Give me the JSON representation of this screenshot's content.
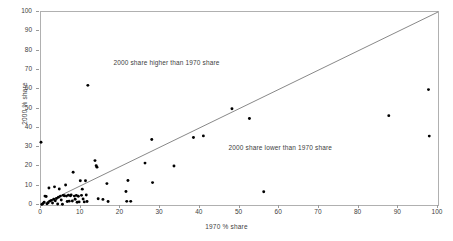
{
  "chart_data": {
    "type": "scatter",
    "title": "",
    "xlabel": "1970 % share",
    "ylabel": "2000 % share",
    "xlim": [
      0,
      100
    ],
    "ylim": [
      0,
      100
    ],
    "xticks": [
      0,
      10,
      20,
      30,
      40,
      50,
      60,
      70,
      80,
      90,
      100
    ],
    "yticks": [
      0,
      10,
      20,
      30,
      40,
      50,
      60,
      70,
      80,
      90,
      100
    ],
    "grid": false,
    "legend": null,
    "marker_color": "#000000",
    "reference_line": {
      "name": "equality-line",
      "from": [
        0,
        0
      ],
      "to": [
        100,
        100
      ],
      "color": "#555555"
    },
    "annotations": [
      {
        "text": "2000 share higher than 1970 share",
        "x": 18.5,
        "y": 73
      },
      {
        "text": "2000 share lower than 1970 share",
        "x": 47.5,
        "y": 29
      }
    ],
    "points": [
      [
        0.0,
        32.5
      ],
      [
        0.2,
        0.3
      ],
      [
        0.5,
        0.8
      ],
      [
        0.8,
        1.5
      ],
      [
        1.0,
        4.6
      ],
      [
        1.3,
        4.4
      ],
      [
        1.5,
        0.6
      ],
      [
        1.8,
        1.2
      ],
      [
        2.0,
        8.8
      ],
      [
        2.2,
        2.0
      ],
      [
        2.6,
        2.4
      ],
      [
        2.9,
        1.0
      ],
      [
        3.2,
        3.0
      ],
      [
        3.4,
        9.4
      ],
      [
        3.6,
        2.2
      ],
      [
        3.9,
        3.4
      ],
      [
        4.2,
        0.5
      ],
      [
        4.4,
        4.0
      ],
      [
        4.6,
        8.3
      ],
      [
        4.9,
        4.6
      ],
      [
        5.1,
        2.6
      ],
      [
        5.4,
        0.4
      ],
      [
        5.6,
        5.0
      ],
      [
        5.9,
        4.8
      ],
      [
        6.2,
        10.4
      ],
      [
        6.4,
        4.6
      ],
      [
        6.6,
        1.8
      ],
      [
        6.9,
        5.1
      ],
      [
        7.1,
        2.0
      ],
      [
        7.4,
        4.8
      ],
      [
        7.6,
        5.2
      ],
      [
        7.9,
        2.1
      ],
      [
        8.1,
        17.0
      ],
      [
        8.4,
        4.6
      ],
      [
        8.6,
        3.0
      ],
      [
        8.9,
        5.0
      ],
      [
        9.1,
        1.4
      ],
      [
        9.4,
        4.5
      ],
      [
        9.6,
        1.6
      ],
      [
        9.9,
        12.6
      ],
      [
        10.2,
        5.0
      ],
      [
        10.4,
        8.2
      ],
      [
        10.6,
        3.1
      ],
      [
        10.9,
        1.6
      ],
      [
        11.2,
        12.6
      ],
      [
        11.4,
        5.2
      ],
      [
        11.6,
        1.8
      ],
      [
        11.8,
        62.0
      ],
      [
        13.6,
        23.0
      ],
      [
        13.9,
        20.4
      ],
      [
        14.1,
        19.6
      ],
      [
        14.4,
        3.2
      ],
      [
        15.6,
        2.9
      ],
      [
        16.6,
        11.1
      ],
      [
        16.9,
        1.8
      ],
      [
        21.4,
        7.0
      ],
      [
        21.6,
        1.9
      ],
      [
        21.9,
        12.7
      ],
      [
        22.6,
        1.9
      ],
      [
        26.2,
        21.7
      ],
      [
        27.9,
        33.9
      ],
      [
        28.1,
        11.6
      ],
      [
        33.5,
        20.2
      ],
      [
        38.4,
        35.0
      ],
      [
        40.9,
        35.8
      ],
      [
        48.1,
        49.9
      ],
      [
        52.5,
        44.8
      ],
      [
        56.1,
        6.9
      ],
      [
        87.6,
        46.3
      ],
      [
        97.6,
        59.8
      ],
      [
        97.8,
        35.7
      ]
    ]
  }
}
